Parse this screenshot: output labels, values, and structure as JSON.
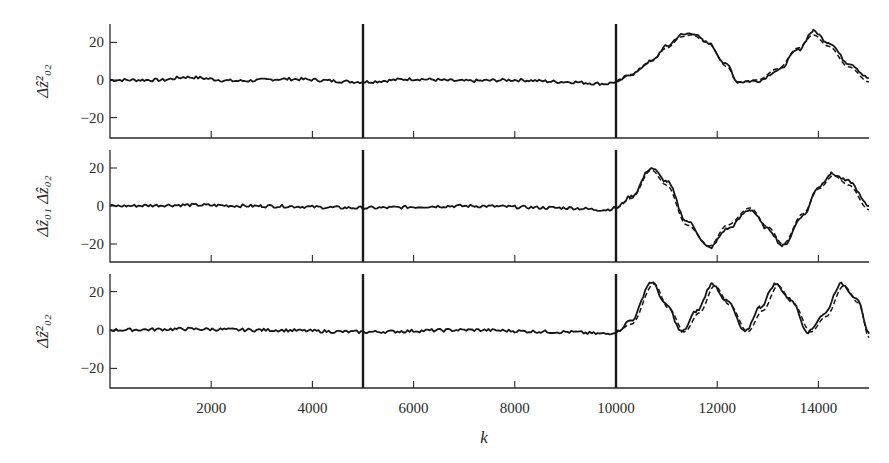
{
  "figure": {
    "x_axis_label": "k",
    "x_ticks": [
      "2000",
      "4000",
      "6000",
      "8000",
      "10000",
      "12000",
      "14000"
    ],
    "y_ticks": [
      "20",
      "0",
      "−20"
    ],
    "panels": [
      {
        "ylabel_main": "Δz",
        "ylabel_sup": "2",
        "ylabel_sub": "02",
        "ylabel_text": "Δẑ²₀₂"
      },
      {
        "ylabel_main": "Δz₀₁ Δz₀₂",
        "ylabel_text": "Δẑ₀₁ Δẑ₀₂"
      },
      {
        "ylabel_main": "Δz",
        "ylabel_sup": "2",
        "ylabel_sub": "02",
        "ylabel_text": "Δẑ²₀₂"
      }
    ]
  },
  "chart_data": {
    "type": "line",
    "title": "",
    "xlabel": "k",
    "xlim": [
      0,
      15000
    ],
    "x_ticks": [
      2000,
      4000,
      6000,
      8000,
      10000,
      12000,
      14000
    ],
    "vertical_markers": [
      5000,
      10000
    ],
    "grid": false,
    "legend": "none",
    "panels": [
      {
        "ylabel": "Δẑ²_02 (hat)",
        "ylim": [
          -30,
          30
        ],
        "y_ticks": [
          -20,
          0,
          20
        ],
        "series": [
          {
            "name": "estimate (solid)",
            "style": "solid",
            "x": [
              0,
              1000,
              1500,
              2500,
              3500,
              5000,
              6000,
              7000,
              8000,
              9000,
              9800,
              10000,
              10300,
              10700,
              11000,
              11300,
              11500,
              11800,
              12200,
              12400,
              12800,
              13200,
              13600,
              13900,
              14200,
              14600,
              15000
            ],
            "y": [
              0,
              0,
              1.5,
              -0.5,
              0.5,
              -1,
              0.5,
              -0.5,
              0,
              -1,
              -2,
              -1,
              3,
              10,
              18,
              24,
              25,
              20,
              8,
              -1,
              -0.5,
              5,
              16,
              26,
              20,
              9,
              1
            ]
          },
          {
            "name": "true (dashed)",
            "style": "dashed",
            "x": [
              10000,
              10300,
              10700,
              11000,
              11300,
              11500,
              11800,
              12200,
              12400,
              12800,
              13200,
              13600,
              13900,
              14200,
              14600,
              15000
            ],
            "y": [
              -1,
              3,
              10,
              17,
              23,
              24,
              20,
              7,
              -1,
              0,
              6,
              17,
              24,
              18,
              7,
              -1
            ]
          }
        ]
      },
      {
        "ylabel": "Δẑ_01 Δẑ_02",
        "ylim": [
          -30,
          30
        ],
        "y_ticks": [
          -20,
          0,
          20
        ],
        "series": [
          {
            "name": "estimate (solid)",
            "style": "solid",
            "x": [
              0,
              1500,
              3000,
              5000,
              7000,
              9000,
              9800,
              10000,
              10300,
              10700,
              11000,
              11400,
              11850,
              12200,
              12650,
              13000,
              13300,
              13700,
              14000,
              14250,
              14600,
              15000
            ],
            "y": [
              0,
              0.5,
              0,
              -1,
              0,
              -1,
              -2,
              -1,
              5,
              20,
              13,
              -8,
              -22,
              -12,
              -2,
              -12,
              -21,
              -5,
              10,
              17,
              13,
              0
            ]
          },
          {
            "name": "true (dashed)",
            "style": "dashed",
            "x": [
              10000,
              10300,
              10700,
              11000,
              11400,
              11850,
              12200,
              12650,
              13000,
              13300,
              13700,
              14000,
              14300,
              14600,
              15000
            ],
            "y": [
              -1,
              4,
              19,
              11,
              -10,
              -21,
              -10,
              -1,
              -11,
              -20,
              -4,
              9,
              16,
              11,
              -2
            ]
          }
        ]
      },
      {
        "ylabel": "Δẑ²_02 (hat)",
        "ylim": [
          -30,
          30
        ],
        "y_ticks": [
          -20,
          0,
          20
        ],
        "series": [
          {
            "name": "estimate (solid)",
            "style": "solid",
            "x": [
              0,
              1500,
              3000,
              5000,
              7000,
              9000,
              9800,
              10000,
              10300,
              10700,
              11000,
              11300,
              11600,
              11900,
              12200,
              12550,
              12850,
              13150,
              13450,
              13800,
              14100,
              14450,
              14750,
              15000
            ],
            "y": [
              0,
              0.5,
              0,
              -1,
              0,
              -1,
              -2,
              -1,
              5,
              25,
              13,
              -1,
              10,
              24,
              15,
              -1,
              12,
              24,
              16,
              -1,
              8,
              24,
              17,
              -2
            ]
          },
          {
            "name": "true (dashed)",
            "style": "dashed",
            "x": [
              10000,
              10300,
              10750,
              11050,
              11350,
              11650,
              11950,
              12250,
              12600,
              12900,
              13200,
              13500,
              13850,
              14150,
              14500,
              14800,
              15000
            ],
            "y": [
              -1,
              3,
              24,
              11,
              -1,
              9,
              23,
              13,
              -1,
              10,
              23,
              14,
              -1,
              7,
              23,
              14,
              -4
            ]
          }
        ]
      }
    ]
  }
}
